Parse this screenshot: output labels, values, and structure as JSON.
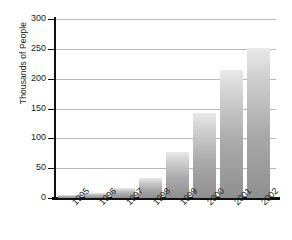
{
  "chart_data": {
    "type": "bar",
    "title": "",
    "xlabel": "",
    "ylabel": "Thousands of People",
    "categories": [
      "1995",
      "1996",
      "1997",
      "1998",
      "1999",
      "2000",
      "2001",
      "2002"
    ],
    "values": [
      5,
      9,
      16,
      34,
      77,
      142,
      215,
      252
    ],
    "ylim": [
      0,
      300
    ],
    "yticks": [
      0,
      50,
      100,
      150,
      200,
      250,
      300
    ],
    "ytick_labels": [
      "0",
      "50",
      "100",
      "150",
      "200",
      "250",
      "300"
    ],
    "grid": true,
    "legend": null,
    "series": [
      {
        "name": "Thousands of People",
        "values": [
          5,
          9,
          16,
          34,
          77,
          142,
          215,
          252
        ]
      }
    ],
    "colors": {
      "bar_top": "#e9e9e9",
      "bar_bottom": "#8f8f8f",
      "gridline": "#b9b9b9",
      "axis": "#111111",
      "text": "#1a1a1a",
      "background": "#ffffff"
    }
  }
}
